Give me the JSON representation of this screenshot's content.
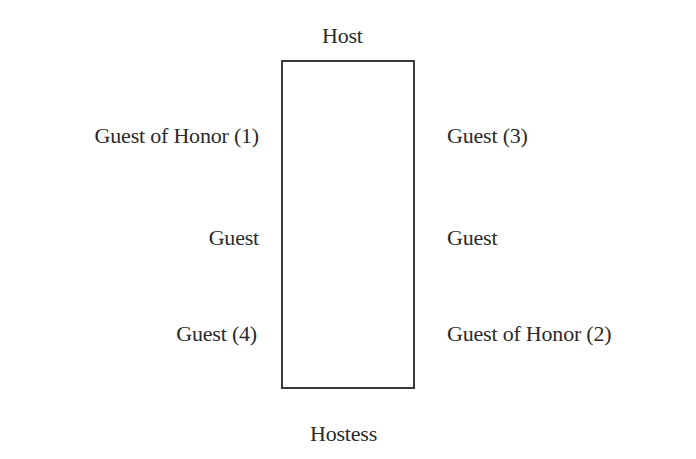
{
  "diagram": {
    "type": "seating-chart",
    "table_shape": "rectangle",
    "top": {
      "label": "Host"
    },
    "bottom": {
      "label": "Hostess"
    },
    "left_side": [
      {
        "label": "Guest of Honor (1)"
      },
      {
        "label": "Guest"
      },
      {
        "label": "Guest (4)"
      }
    ],
    "right_side": [
      {
        "label": "Guest (3)"
      },
      {
        "label": "Guest"
      },
      {
        "label": "Guest of Honor (2)"
      }
    ],
    "colors": {
      "text": "#2b2b2b",
      "table_border": "#3a3a3a",
      "background": "#ffffff"
    }
  }
}
